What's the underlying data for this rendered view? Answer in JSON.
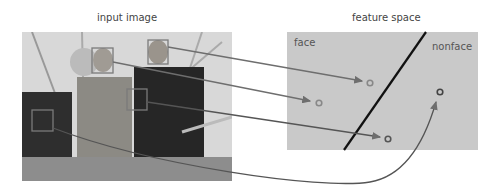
{
  "titles": {
    "input": "input image",
    "feature": "feature space"
  },
  "regions": {
    "face": "face",
    "nonface": "nonface"
  },
  "colors": {
    "box": "#7a7a7a",
    "arrow": "#6e6e6e",
    "boundary": "#111111",
    "point": "#777777",
    "panel": "#c9c9c9"
  },
  "boxes": [
    {
      "name": "face-box-left-man",
      "x": 92,
      "y": 48,
      "w": 21,
      "h": 25
    },
    {
      "name": "face-box-right-man",
      "x": 148,
      "y": 40,
      "w": 20,
      "h": 24
    },
    {
      "name": "hand-box",
      "x": 127,
      "y": 89,
      "w": 20,
      "h": 21
    },
    {
      "name": "chair-box",
      "x": 32,
      "y": 110,
      "w": 21,
      "h": 21
    }
  ],
  "points": [
    {
      "name": "point-face-1",
      "x": 370,
      "y": 83,
      "class": "face"
    },
    {
      "name": "point-face-2",
      "x": 319,
      "y": 103,
      "class": "face"
    },
    {
      "name": "point-face-3",
      "x": 388,
      "y": 139,
      "class": "face"
    },
    {
      "name": "point-nonface-1",
      "x": 440,
      "y": 92,
      "class": "nonface"
    }
  ]
}
